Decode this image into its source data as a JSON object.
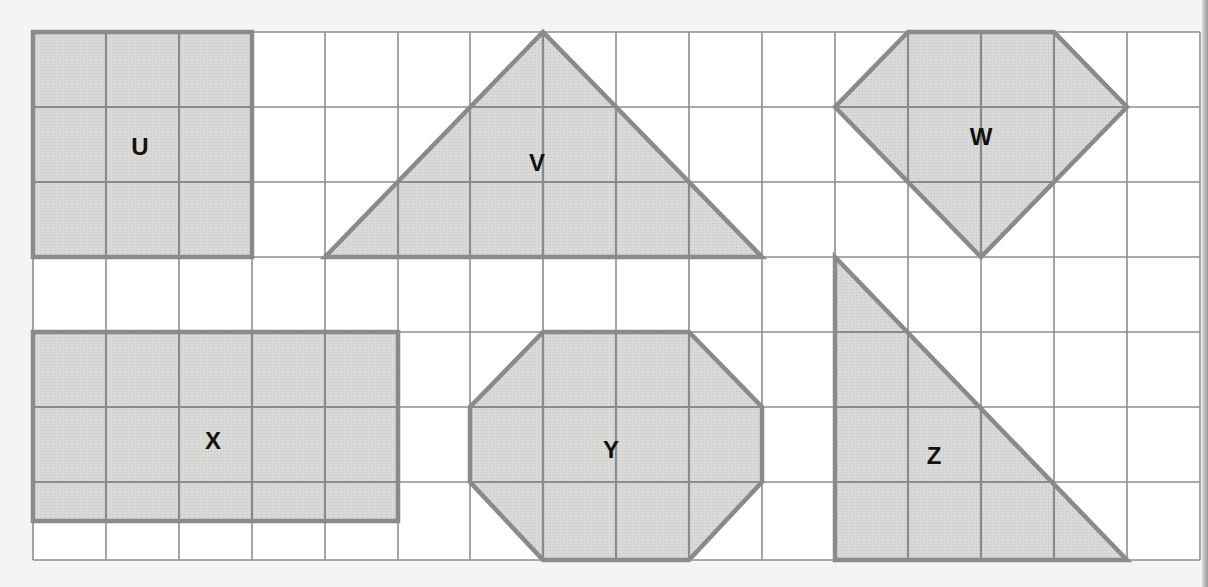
{
  "figure": {
    "type": "grid-shapes-diagram",
    "grid": {
      "columns": 16,
      "rows": 7,
      "origin_px": [
        33,
        32
      ],
      "cell_width_px": 73,
      "cell_height_px": 75,
      "x_lines_px": [
        33,
        106,
        179,
        252,
        325,
        398,
        470,
        543,
        616,
        689,
        762,
        835,
        908,
        981,
        1054,
        1127,
        1200
      ],
      "y_lines_px": [
        32,
        107,
        182,
        257,
        332,
        407,
        482,
        560
      ],
      "line_color": "#8e8e8e",
      "background": "#ffffff"
    },
    "colors": {
      "shape_fill": "#d9d9d7",
      "shape_stroke": "#8a8a8a",
      "label": "#111111",
      "page": "#f4f4f2"
    },
    "shapes": [
      {
        "label": "U",
        "kind": "square",
        "points_grid": [
          [
            0,
            0
          ],
          [
            3,
            0
          ],
          [
            3,
            3
          ],
          [
            0,
            3
          ]
        ],
        "label_pos_px": [
          140,
          146
        ]
      },
      {
        "label": "V",
        "kind": "triangle",
        "points_grid": [
          [
            4,
            3
          ],
          [
            7,
            0
          ],
          [
            10,
            3
          ]
        ],
        "label_pos_px": [
          537,
          162
        ]
      },
      {
        "label": "W",
        "kind": "pentagon",
        "points_grid": [
          [
            12,
            0
          ],
          [
            14,
            0
          ],
          [
            15,
            1
          ],
          [
            13,
            3
          ],
          [
            11,
            1
          ]
        ],
        "label_pos_px": [
          981,
          136
        ]
      },
      {
        "label": "X",
        "kind": "rectangle",
        "points_grid": [
          [
            0,
            4
          ],
          [
            5,
            4
          ],
          [
            5,
            6.5
          ],
          [
            0,
            6.5
          ]
        ],
        "label_pos_px": [
          213,
          440
        ]
      },
      {
        "label": "Y",
        "kind": "octagon",
        "points_grid": [
          [
            7,
            4
          ],
          [
            9,
            4
          ],
          [
            10,
            5
          ],
          [
            10,
            6
          ],
          [
            9,
            7
          ],
          [
            7,
            7
          ],
          [
            6,
            6
          ],
          [
            6,
            5
          ]
        ],
        "label_pos_px": [
          611,
          449
        ]
      },
      {
        "label": "Z",
        "kind": "right-triangle",
        "points_grid": [
          [
            11,
            3
          ],
          [
            11,
            7
          ],
          [
            15,
            7
          ]
        ],
        "label_pos_px": [
          934,
          455
        ]
      }
    ]
  }
}
